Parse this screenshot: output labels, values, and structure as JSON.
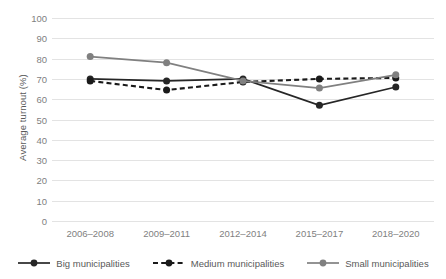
{
  "chart_data": {
    "type": "line",
    "title": "",
    "xlabel": "",
    "ylabel": "Average turnout (%)",
    "categories": [
      "2006–2008",
      "2009–2011",
      "2012–2014",
      "2015–2017",
      "2018–2020"
    ],
    "ylim": [
      0,
      100
    ],
    "ytick_step": 10,
    "yticks": [
      100,
      90,
      80,
      70,
      60,
      50,
      40,
      30,
      20,
      10,
      0
    ],
    "grid": true,
    "legend_position": "bottom",
    "series": [
      {
        "name": "Big municipalities",
        "values": [
          70,
          69,
          70,
          57,
          66
        ],
        "color": "#262626",
        "dash": "solid",
        "marker": "circle"
      },
      {
        "name": "Medium municipalities",
        "values": [
          69,
          64.5,
          68.5,
          70,
          70.5
        ],
        "color": "#1a1a1a",
        "dash": "dashed",
        "marker": "circle"
      },
      {
        "name": "Small municipalities",
        "values": [
          81,
          78,
          69,
          65.5,
          72
        ],
        "color": "#808080",
        "dash": "solid",
        "marker": "circle"
      }
    ]
  },
  "axis": {
    "y_title": "Average turnout (%)",
    "y_labels": [
      "100",
      "90",
      "80",
      "70",
      "60",
      "50",
      "40",
      "30",
      "20",
      "10",
      "0"
    ],
    "x_labels": [
      "2006–2008",
      "2009–2011",
      "2012–2014",
      "2015–2017",
      "2018–2020"
    ]
  },
  "legend": {
    "items": [
      {
        "label": "Big municipalities",
        "icon": "solid-line-marker-icon"
      },
      {
        "label": "Medium municipalities",
        "icon": "dashed-line-marker-icon"
      },
      {
        "label": "Small municipalities",
        "icon": "gray-line-marker-icon"
      }
    ]
  },
  "colors": {
    "grid": "#e3e3e3",
    "tick_text": "#7f7f7f",
    "title_text": "#595959",
    "series_big": "#262626",
    "series_medium": "#1a1a1a",
    "series_small": "#808080",
    "background": "#ffffff"
  }
}
